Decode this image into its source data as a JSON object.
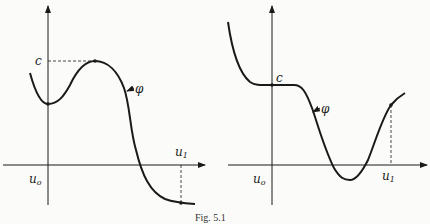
{
  "caption": "Fig. 5.1",
  "left_panel": {
    "labels": {
      "c": "c",
      "phi": "φ",
      "u0": "u",
      "u0_sub": "o",
      "u1": "u",
      "u1_sub": "1"
    }
  },
  "right_panel": {
    "labels": {
      "c": "c",
      "phi": "φ",
      "u0": "u",
      "u0_sub": "o",
      "u1": "u",
      "u1_sub": "1"
    }
  },
  "colors": {
    "ink": "#1a1a1a",
    "paper": "#fbfbf9"
  }
}
